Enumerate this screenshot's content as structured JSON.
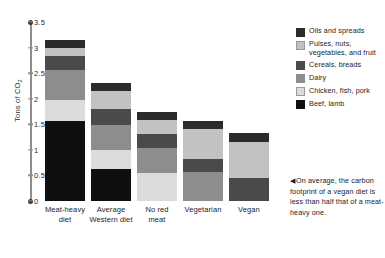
{
  "chart_data": {
    "type": "bar",
    "stacked": true,
    "title": "",
    "xlabel": "",
    "ylabel": "Tons of CO2",
    "ylabel_display": "Tons of CO",
    "ylabel_sub": "2",
    "ylim": [
      0,
      3.5
    ],
    "yticks": [
      "0",
      "0.5",
      "1",
      "1.5",
      "2",
      "2.5",
      "3",
      "3.5"
    ],
    "ytick_values": [
      0,
      0.5,
      1,
      1.5,
      2,
      2.5,
      3,
      3.5
    ],
    "grid": false,
    "legend_position": "right",
    "categories": [
      "Meat-heavy diet",
      "Average Western diet",
      "No red meat",
      "Vegetarian",
      "Vegan"
    ],
    "category_lines": [
      [
        "Meat-heavy",
        "diet"
      ],
      [
        "Average",
        "Western diet"
      ],
      [
        "No red",
        "meat"
      ],
      [
        "Vegetarian",
        ""
      ],
      [
        "Vegan",
        ""
      ]
    ],
    "series": [
      {
        "name": "Beef, lamb",
        "color": "#0f0f0f",
        "values": [
          1.56,
          0.63,
          0.0,
          0.0,
          0.0
        ]
      },
      {
        "name": "Chicken, fish, pork",
        "color": "#dcdcdc",
        "values": [
          0.42,
          0.36,
          0.55,
          0.0,
          0.0
        ]
      },
      {
        "name": "Dairy",
        "color": "#8d8d8d",
        "values": [
          0.58,
          0.5,
          0.48,
          0.56,
          0.0
        ]
      },
      {
        "name": "Cereals, breads",
        "color": "#4a4a4a",
        "values": [
          0.28,
          0.3,
          0.28,
          0.26,
          0.45
        ]
      },
      {
        "name": "Pulses, nuts, vegetables, and fruit",
        "color": "#c2c2c2",
        "values": [
          0.16,
          0.37,
          0.27,
          0.58,
          0.7
        ]
      },
      {
        "name": "Oils and spreads",
        "color": "#2b2b2b",
        "values": [
          0.15,
          0.14,
          0.17,
          0.17,
          0.18
        ]
      }
    ],
    "totals": [
      3.15,
      2.3,
      1.75,
      1.57,
      1.33
    ],
    "annotations": [
      "On average, the carbon footprint of a vegan diet is less than half that of a meat-heavy one."
    ]
  },
  "legend": {
    "items": [
      {
        "label": "Oils and spreads",
        "color": "#2b2b2b"
      },
      {
        "label": "Pulses, nuts, vegetables, and fruit",
        "color": "#c2c2c2"
      },
      {
        "label": "Cereals, breads",
        "color": "#4a4a4a"
      },
      {
        "label": "Dairy",
        "color": "#8d8d8d"
      },
      {
        "label": "Chicken, fish, pork",
        "color": "#dcdcdc"
      },
      {
        "label": "Beef, lamb",
        "color": "#0f0f0f"
      }
    ]
  },
  "caption": {
    "arrow": "◀",
    "text": "On average, the carbon footprint of a vegan diet is less than half that of a meat-heavy one."
  }
}
